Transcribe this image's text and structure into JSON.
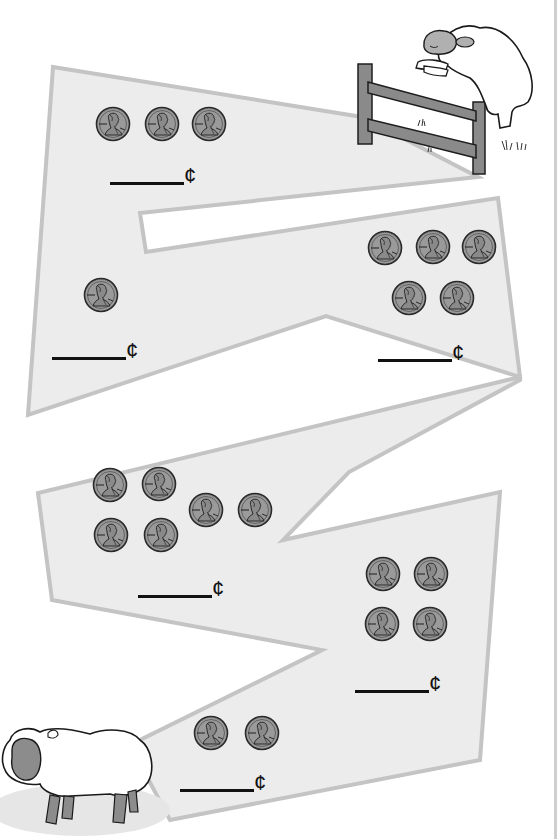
{
  "worksheet": {
    "currency_symbol": "¢",
    "coin_type": "penny",
    "coin_value_cents": 1,
    "colors": {
      "path_fill": "#ececec",
      "path_stroke": "#c4c4c4",
      "penny_fill": "#9a9a9a",
      "penny_outline": "#2a2a2a",
      "answer_line": "#111111",
      "sheep_face": "#8c8c8c"
    },
    "problems": [
      {
        "id": 1,
        "penny_count": 3,
        "answer": "",
        "cent_label": "¢"
      },
      {
        "id": 2,
        "penny_count": 5,
        "answer": "",
        "cent_label": "¢"
      },
      {
        "id": 3,
        "penny_count": 1,
        "answer": "",
        "cent_label": "¢"
      },
      {
        "id": 4,
        "penny_count": 6,
        "answer": "",
        "cent_label": "¢"
      },
      {
        "id": 5,
        "penny_count": 4,
        "answer": "",
        "cent_label": "¢"
      },
      {
        "id": 6,
        "penny_count": 2,
        "answer": "",
        "cent_label": "¢"
      }
    ],
    "illustrations": {
      "top": "sheep-jumping-fence",
      "bottom": "sheep-standing"
    }
  }
}
